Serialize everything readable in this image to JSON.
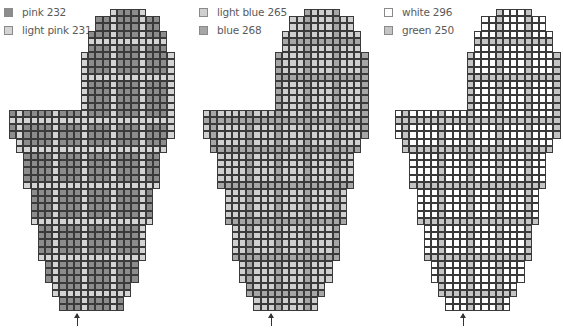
{
  "charts": [
    {
      "name": "pink-heart-chart",
      "legend": [
        {
          "label": "pink 232",
          "color": "#8c8c8c"
        },
        {
          "label": "light pink 231",
          "color": "#d4d4d4"
        }
      ],
      "main_color": "#8c8c8c",
      "stripe_color": "#d4d4d4",
      "stripe_rows": [
        4,
        9,
        15,
        19,
        24,
        29,
        34,
        39
      ],
      "stripe_cols": [
        1,
        6,
        10,
        14,
        18,
        22
      ]
    },
    {
      "name": "blue-heart-chart",
      "legend": [
        {
          "label": "light blue 265",
          "color": "#cfcfcf"
        },
        {
          "label": "blue 268",
          "color": "#a6a6a6"
        }
      ],
      "main_color": "#cfcfcf",
      "stripe_color": "#a6a6a6",
      "stripe_rows": [
        4,
        9,
        15,
        19,
        24,
        29,
        34,
        39
      ],
      "stripe_cols": [
        1,
        6,
        10,
        14,
        18,
        22
      ]
    },
    {
      "name": "green-heart-chart",
      "legend": [
        {
          "label": "white 296",
          "color": "#ffffff"
        },
        {
          "label": "green 250",
          "color": "#c4c4c4"
        }
      ],
      "main_color": "#ffffff",
      "stripe_color": "#c4c4c4",
      "stripe_rows": [
        4,
        9,
        15,
        19,
        24,
        29,
        34,
        39
      ],
      "stripe_cols": [
        1,
        6,
        10,
        14,
        18,
        22
      ]
    }
  ],
  "shape_rows": [
    [
      14,
      18
    ],
    [
      12,
      20
    ],
    [
      12,
      20
    ],
    [
      11,
      21
    ],
    [
      11,
      21
    ],
    [
      11,
      21
    ],
    [
      10,
      22
    ],
    [
      10,
      22
    ],
    [
      10,
      22
    ],
    [
      10,
      22
    ],
    [
      10,
      22
    ],
    [
      10,
      22
    ],
    [
      10,
      22
    ],
    [
      10,
      22
    ],
    [
      0,
      22
    ],
    [
      0,
      22
    ],
    [
      0,
      22
    ],
    [
      0,
      22
    ],
    [
      1,
      21
    ],
    [
      1,
      21
    ],
    [
      2,
      20
    ],
    [
      2,
      20
    ],
    [
      2,
      20
    ],
    [
      2,
      20
    ],
    [
      2,
      20
    ],
    [
      3,
      19
    ],
    [
      3,
      19
    ],
    [
      3,
      19
    ],
    [
      3,
      19
    ],
    [
      3,
      19
    ],
    [
      4,
      18
    ],
    [
      4,
      18
    ],
    [
      4,
      18
    ],
    [
      4,
      18
    ],
    [
      4,
      18
    ],
    [
      5,
      17
    ],
    [
      5,
      17
    ],
    [
      5,
      17
    ],
    [
      6,
      16
    ],
    [
      6,
      16
    ],
    [
      7,
      15
    ],
    [
      7,
      15
    ]
  ],
  "arrow_col": 9
}
